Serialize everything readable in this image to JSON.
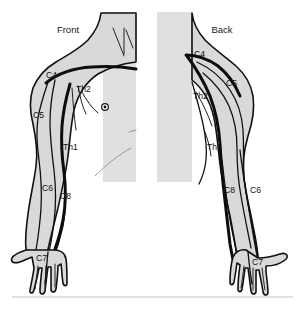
{
  "figure": {
    "name": "dermatome-map-upper-limb",
    "background_color": "#ffffff",
    "panel_color": "#e0e0e0",
    "limb_color": "#d9d9d9",
    "line_color": "#111111",
    "width": 305,
    "height": 310
  },
  "views": [
    {
      "id": "front",
      "title": "Front",
      "title_x": 68,
      "title_y": 33
    },
    {
      "id": "back",
      "title": "Back",
      "title_x": 222,
      "title_y": 33
    }
  ],
  "front_labels": [
    {
      "text": "C4",
      "x": 46,
      "y": 78
    },
    {
      "text": "Th2",
      "x": 76,
      "y": 92
    },
    {
      "text": "C5",
      "x": 33,
      "y": 118
    },
    {
      "text": "Th1",
      "x": 63,
      "y": 150
    },
    {
      "text": "C6",
      "x": 42,
      "y": 191
    },
    {
      "text": "C8",
      "x": 60,
      "y": 199
    },
    {
      "text": "C7",
      "x": 36,
      "y": 261
    }
  ],
  "back_labels": [
    {
      "text": "C4",
      "x": 194,
      "y": 57
    },
    {
      "text": "C5",
      "x": 226,
      "y": 86
    },
    {
      "text": "Th2",
      "x": 193,
      "y": 99
    },
    {
      "text": "Th1",
      "x": 207,
      "y": 150
    },
    {
      "text": "C8",
      "x": 224,
      "y": 193
    },
    {
      "text": "C6",
      "x": 250,
      "y": 193
    },
    {
      "text": "C7",
      "x": 252,
      "y": 265
    }
  ],
  "markers": [
    {
      "name": "nipple-marker",
      "view": "front",
      "x": 105,
      "y": 107,
      "outer_r": 3.4,
      "inner_r": 1.4
    }
  ],
  "separator": {
    "x1": 12,
    "y1": 297,
    "x2": 293,
    "y2": 297
  }
}
